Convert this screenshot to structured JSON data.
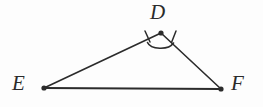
{
  "figure": {
    "kind": "geometry-diagram",
    "background_color": "#fdfdfd",
    "stroke_color": "#2b2b2b",
    "label_color": "#2b2b2b",
    "canvas": {
      "width": 263,
      "height": 107
    },
    "vertices": [
      {
        "id": "D",
        "label": "D",
        "x": 161,
        "y": 33,
        "dot_radius": 2.6,
        "label_x": 150,
        "label_y": 2
      },
      {
        "id": "E",
        "label": "E",
        "x": 44,
        "y": 88,
        "dot_radius": 2.6,
        "label_x": 12,
        "label_y": 73
      },
      {
        "id": "F",
        "label": "F",
        "x": 221,
        "y": 89,
        "dot_radius": 2.6,
        "label_x": 231,
        "label_y": 73
      }
    ],
    "edges": [
      {
        "id": "ED",
        "from": "E",
        "to": "D",
        "x1": 44,
        "y1": 88,
        "x2": 161,
        "y2": 33,
        "stroke_width": 1.6
      },
      {
        "id": "DF",
        "from": "D",
        "to": "F",
        "x1": 161,
        "y1": 33,
        "x2": 221,
        "y2": 89,
        "stroke_width": 1.6
      },
      {
        "id": "EF",
        "from": "E",
        "to": "F",
        "x1": 44,
        "y1": 88,
        "x2": 221,
        "y2": 89,
        "stroke_width": 1.8
      }
    ],
    "angle_marks": [
      {
        "id": "angle-at-D",
        "at_vertex": "D",
        "type": "arc",
        "path": "M 147.5 42.5 C 150.5 49.5, 168.5 50.5, 173.5 43.0",
        "stroke_width": 1.6
      }
    ],
    "tick_marks": [
      {
        "id": "tick-on-ED",
        "on_edge": "ED",
        "x1": 145.0,
        "y1": 31.0,
        "x2": 150.0,
        "y2": 42.0,
        "stroke_width": 1.5
      },
      {
        "id": "tick-on-DF",
        "on_edge": "DF",
        "x1": 176.0,
        "y1": 31.0,
        "x2": 171.5,
        "y2": 42.5,
        "stroke_width": 1.5
      }
    ]
  }
}
